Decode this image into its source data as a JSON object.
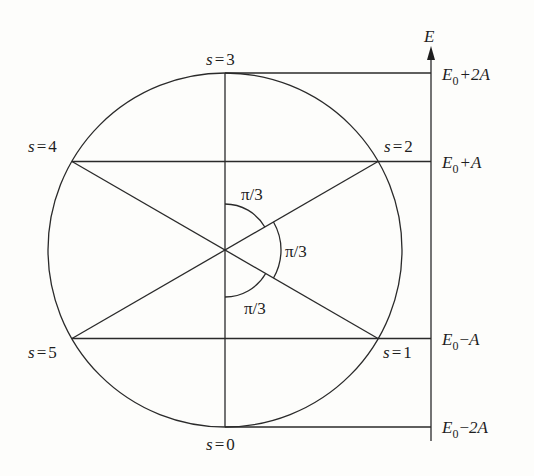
{
  "figure": {
    "axis_label": "E",
    "center": {
      "x": 225,
      "y": 250
    },
    "radius": 177,
    "axis_x": 431,
    "states": [
      {
        "s": "0",
        "label_var": "s",
        "label_eq": "=",
        "label_val": "0"
      },
      {
        "s": "1",
        "label_var": "s",
        "label_eq": "=",
        "label_val": "1"
      },
      {
        "s": "2",
        "label_var": "s",
        "label_eq": "=",
        "label_val": "2"
      },
      {
        "s": "3",
        "label_var": "s",
        "label_eq": "=",
        "label_val": "3"
      },
      {
        "s": "4",
        "label_var": "s",
        "label_eq": "=",
        "label_val": "4"
      },
      {
        "s": "5",
        "label_var": "s",
        "label_eq": "=",
        "label_val": "5"
      }
    ],
    "energy_levels": [
      {
        "base": "E",
        "sub": "0",
        "op": "+",
        "term": "2A"
      },
      {
        "base": "E",
        "sub": "0",
        "op": "+",
        "term": "A"
      },
      {
        "base": "E",
        "sub": "0",
        "op": "−",
        "term": "A"
      },
      {
        "base": "E",
        "sub": "0",
        "op": "−",
        "term": "2A"
      }
    ],
    "angle_labels": [
      {
        "text": "π/3"
      },
      {
        "text": "π/3"
      },
      {
        "text": "π/3"
      }
    ]
  }
}
